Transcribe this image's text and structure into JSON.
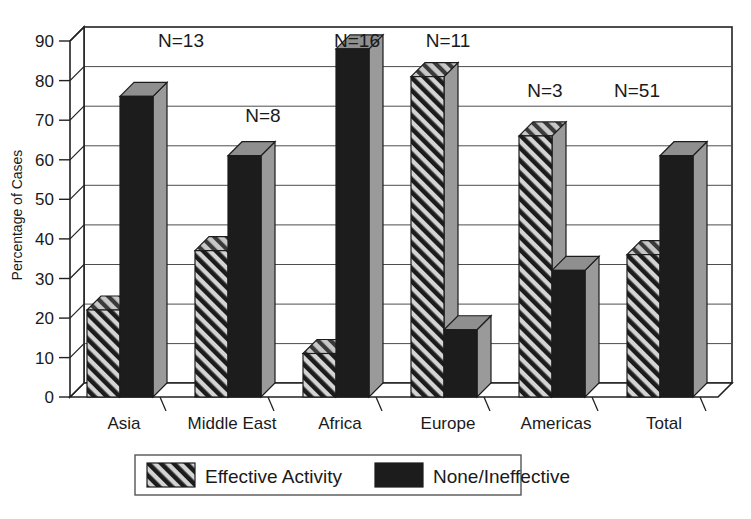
{
  "chart_data": {
    "type": "bar",
    "title": "",
    "xlabel": "",
    "ylabel": "Percentage of Cases",
    "ylim": [
      0,
      90
    ],
    "ytick_step": 10,
    "yticks": [
      "0",
      "10",
      "20",
      "30",
      "40",
      "50",
      "60",
      "70",
      "80",
      "90"
    ],
    "grid": true,
    "grid_axis": "y",
    "legend_position": "bottom",
    "categories": [
      "Asia",
      "Middle East",
      "Africa",
      "Europe",
      "Americas",
      "Total"
    ],
    "series": [
      {
        "name": "Effective Activity",
        "fill": "diagonal-hatch",
        "values": [
          22,
          37,
          11,
          81,
          66,
          36
        ]
      },
      {
        "name": "None/Ineffective",
        "fill": "solid-black",
        "values": [
          76,
          61,
          88,
          17,
          32,
          61
        ]
      }
    ],
    "annotations": [
      {
        "category": "Asia",
        "text": "N=13"
      },
      {
        "category": "Middle East",
        "text": "N=8"
      },
      {
        "category": "Africa",
        "text": "N=16"
      },
      {
        "category": "Europe",
        "text": "N=11"
      },
      {
        "category": "Americas",
        "text": "N=3"
      },
      {
        "category": "Total",
        "text": "N=51"
      }
    ],
    "colors": {
      "bar_front_solid": "#1c1c1c",
      "bar_side": "#9a9a9a",
      "bar_top": "#8f8f8f",
      "hatch_line": "#1c1c1c",
      "hatch_background": "#d9d9d9",
      "axis": "#222222",
      "grid": "#555555",
      "background": "#ffffff",
      "text": "#1a1a1a"
    }
  },
  "legend": {
    "items": [
      {
        "label": "Effective Activity",
        "swatch": "diagonal-hatch"
      },
      {
        "label": "None/Ineffective",
        "swatch": "solid-black"
      }
    ]
  },
  "axis": {
    "y_title": "Percentage of Cases"
  }
}
